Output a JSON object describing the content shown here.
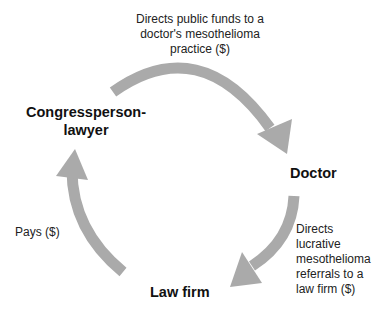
{
  "diagram": {
    "type": "cycle",
    "arrow_color": "#aaaaaa",
    "nodes": {
      "congressperson": {
        "line1": "Congressperson-",
        "line2": "lawyer"
      },
      "doctor": "Doctor",
      "law_firm": "Law firm"
    },
    "edges": {
      "congress_to_doctor": {
        "from": "Congressperson-lawyer",
        "to": "Doctor",
        "lines": [
          "Directs public funds to a",
          "doctor's mesothelioma",
          "practice ($)"
        ]
      },
      "doctor_to_lawfirm": {
        "from": "Doctor",
        "to": "Law firm",
        "lines": [
          "Directs",
          "lucrative",
          "mesothelioma",
          "referrals to a",
          "law firm ($)"
        ]
      },
      "lawfirm_to_congress": {
        "from": "Law firm",
        "to": "Congressperson-lawyer",
        "lines": [
          "Pays ($)"
        ]
      }
    }
  }
}
